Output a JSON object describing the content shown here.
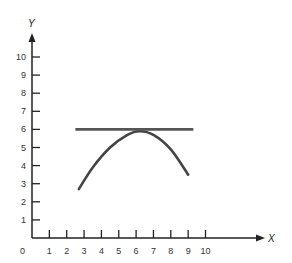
{
  "chart_data": {
    "type": "line",
    "title": "",
    "xlabel": "X",
    "ylabel": "Y",
    "xlim": [
      0,
      10
    ],
    "ylim": [
      0,
      10
    ],
    "grid": false,
    "legend": null,
    "x_ticks": [
      "1",
      "2",
      "3",
      "4",
      "5",
      "6",
      "7",
      "8",
      "9",
      "10"
    ],
    "y_ticks": [
      "1",
      "2",
      "3",
      "4",
      "5",
      "6",
      "7",
      "8",
      "9",
      "10"
    ],
    "origin_label": "0",
    "series": [
      {
        "name": "curve",
        "kind": "parabola",
        "x": [
          2.7,
          3.5,
          4.5,
          5.5,
          6.2,
          7.0,
          8.0,
          9.0
        ],
        "values": [
          2.7,
          3.9,
          5.0,
          5.7,
          5.9,
          5.7,
          4.9,
          3.5
        ]
      },
      {
        "name": "tangent-line",
        "kind": "horizontal",
        "x": [
          2.5,
          9.3
        ],
        "values": [
          6.0,
          6.0
        ]
      }
    ],
    "colors": {
      "axis": "#222222",
      "curve": "#444444",
      "tangent": "#555555"
    }
  }
}
